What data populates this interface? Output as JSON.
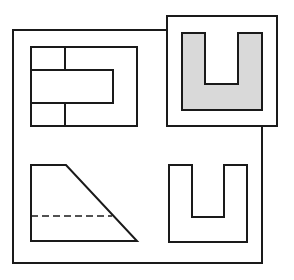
{
  "diagram": {
    "type": "orthographic-projection",
    "colors": {
      "stroke": "#1a1a1a",
      "background": "#ffffff",
      "highlight_fill": "#d9d9d9"
    },
    "frame": {
      "left": 13,
      "top": 30,
      "right": 262,
      "bottom": 263
    },
    "highlight_box": {
      "left": 167,
      "top": 16,
      "right": 277,
      "bottom": 126
    },
    "views": [
      {
        "name": "top-view",
        "position": "top-left",
        "outer_rect": {
          "x1": 31,
          "y1": 47,
          "x2": 137,
          "y2": 126
        },
        "tongue_rect": {
          "x1": 31,
          "y1": 70,
          "x2": 113,
          "y2": 103
        },
        "divider_x": 65
      },
      {
        "name": "highlighted-u-view",
        "position": "top-right",
        "filled": true,
        "outer": {
          "x1": 182,
          "y1": 33,
          "x2": 262,
          "y2": 110
        },
        "notch": {
          "x1": 205,
          "x2": 238,
          "bottom": 84
        }
      },
      {
        "name": "front-view-trapezoid",
        "position": "bottom-left",
        "points": [
          [
            31,
            165
          ],
          [
            66,
            165
          ],
          [
            137,
            241
          ],
          [
            31,
            241
          ]
        ],
        "hidden_line": {
          "y": 216,
          "x1": 31,
          "x2": 112
        }
      },
      {
        "name": "side-view-u",
        "position": "bottom-right",
        "filled": false,
        "outer": {
          "x1": 169,
          "y1": 165,
          "x2": 247,
          "y2": 242
        },
        "notch": {
          "x1": 192,
          "x2": 224,
          "bottom": 217
        }
      }
    ]
  }
}
